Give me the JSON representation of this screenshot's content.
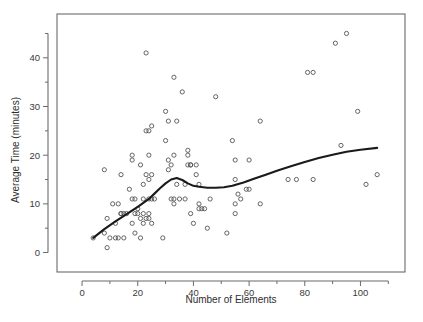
{
  "chart_data": {
    "type": "scatter",
    "title": "",
    "xlabel": "Number of Elements",
    "ylabel": "Average Time (minutes)",
    "xlim": [
      -9,
      116
    ],
    "ylim": [
      -4,
      49
    ],
    "grid": false,
    "legend": "none",
    "x_major_ticks": [
      0,
      20,
      40,
      60,
      80,
      100
    ],
    "x_minor_ticks": [
      10,
      30,
      50,
      70,
      90,
      110
    ],
    "x_tick_labels": [
      "0",
      "20",
      "40",
      "60",
      "80",
      "100"
    ],
    "y_major_ticks": [
      0,
      10,
      20,
      30,
      40
    ],
    "y_minor_ticks": [
      5,
      15,
      25,
      35,
      45
    ],
    "y_tick_labels": [
      "0",
      "10",
      "20",
      "30",
      "40"
    ],
    "marker": "open-circle",
    "marker_color": "#555555",
    "line_color": "#1a1a1a",
    "series": [
      {
        "name": "observations",
        "type": "scatter",
        "points": [
          [
            4,
            3
          ],
          [
            8,
            17
          ],
          [
            8,
            4
          ],
          [
            9,
            1
          ],
          [
            9,
            7
          ],
          [
            10,
            3
          ],
          [
            11,
            10
          ],
          [
            12,
            3
          ],
          [
            12,
            6
          ],
          [
            13,
            10
          ],
          [
            13,
            3
          ],
          [
            14,
            16
          ],
          [
            14,
            8
          ],
          [
            14,
            8
          ],
          [
            15,
            3
          ],
          [
            15,
            8
          ],
          [
            16,
            8
          ],
          [
            17,
            13
          ],
          [
            18,
            19
          ],
          [
            18,
            20
          ],
          [
            18,
            6
          ],
          [
            18,
            11
          ],
          [
            19,
            11
          ],
          [
            19,
            8
          ],
          [
            19,
            4
          ],
          [
            20,
            9
          ],
          [
            20,
            8
          ],
          [
            21,
            3
          ],
          [
            21,
            7
          ],
          [
            21,
            18
          ],
          [
            22,
            14
          ],
          [
            22,
            11
          ],
          [
            22,
            8
          ],
          [
            22,
            6
          ],
          [
            23,
            41
          ],
          [
            23,
            25
          ],
          [
            23,
            16
          ],
          [
            23,
            7
          ],
          [
            24,
            25
          ],
          [
            24,
            20
          ],
          [
            24,
            15
          ],
          [
            24,
            11
          ],
          [
            24,
            8
          ],
          [
            24,
            7
          ],
          [
            25,
            26
          ],
          [
            25,
            16
          ],
          [
            25,
            11
          ],
          [
            25,
            6
          ],
          [
            26,
            11
          ],
          [
            29,
            3
          ],
          [
            30,
            29
          ],
          [
            30,
            23
          ],
          [
            31,
            27
          ],
          [
            31,
            19
          ],
          [
            31,
            17
          ],
          [
            32,
            18
          ],
          [
            32,
            11
          ],
          [
            33,
            36
          ],
          [
            33,
            20
          ],
          [
            33,
            11
          ],
          [
            33,
            10
          ],
          [
            34,
            27
          ],
          [
            34,
            14
          ],
          [
            35,
            11
          ],
          [
            36,
            33
          ],
          [
            37,
            14
          ],
          [
            37,
            11
          ],
          [
            38,
            21
          ],
          [
            38,
            20
          ],
          [
            38,
            18
          ],
          [
            39,
            18
          ],
          [
            39,
            18
          ],
          [
            39,
            8
          ],
          [
            40,
            6
          ],
          [
            41,
            18
          ],
          [
            41,
            16
          ],
          [
            42,
            10
          ],
          [
            42,
            9
          ],
          [
            42,
            14
          ],
          [
            43,
            9
          ],
          [
            44,
            9
          ],
          [
            45,
            5
          ],
          [
            46,
            11
          ],
          [
            48,
            32
          ],
          [
            52,
            4
          ],
          [
            54,
            23
          ],
          [
            55,
            19
          ],
          [
            55,
            10
          ],
          [
            55,
            8
          ],
          [
            55,
            15
          ],
          [
            56,
            12
          ],
          [
            57,
            11
          ],
          [
            59,
            13
          ],
          [
            60,
            19
          ],
          [
            60,
            13
          ],
          [
            64,
            27
          ],
          [
            64,
            10
          ],
          [
            74,
            15
          ],
          [
            77,
            15
          ],
          [
            81,
            37
          ],
          [
            83,
            37
          ],
          [
            83,
            15
          ],
          [
            91,
            43
          ],
          [
            93,
            22
          ],
          [
            95,
            45
          ],
          [
            99,
            29
          ],
          [
            102,
            14
          ],
          [
            106,
            16
          ]
        ]
      },
      {
        "name": "smoothed-trend",
        "type": "line",
        "points": [
          [
            4,
            3.0
          ],
          [
            8,
            4.8
          ],
          [
            12,
            6.4
          ],
          [
            16,
            7.9
          ],
          [
            20,
            9.4
          ],
          [
            24,
            11.0
          ],
          [
            26,
            12.1
          ],
          [
            28,
            13.2
          ],
          [
            30,
            14.2
          ],
          [
            32,
            15.0
          ],
          [
            34,
            15.3
          ],
          [
            36,
            14.9
          ],
          [
            38,
            14.2
          ],
          [
            40,
            13.7
          ],
          [
            42,
            13.5
          ],
          [
            45,
            13.3
          ],
          [
            48,
            13.3
          ],
          [
            51,
            13.4
          ],
          [
            54,
            13.7
          ],
          [
            58,
            14.4
          ],
          [
            62,
            15.2
          ],
          [
            66,
            16.0
          ],
          [
            70,
            16.8
          ],
          [
            75,
            17.7
          ],
          [
            80,
            18.6
          ],
          [
            85,
            19.4
          ],
          [
            90,
            20.1
          ],
          [
            95,
            20.7
          ],
          [
            100,
            21.1
          ],
          [
            106,
            21.5
          ]
        ]
      }
    ]
  }
}
